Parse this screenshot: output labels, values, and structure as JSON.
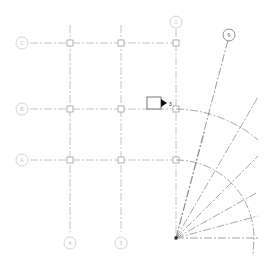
{
  "view": {
    "title": "Grid Plan View"
  },
  "colors": {
    "grid_line": "#b8b8b8",
    "radial_line": "#909090",
    "bubble": "#c8c8c8",
    "marker": "#a0a0a0",
    "elevation_tag": "#111111"
  },
  "grids": {
    "vertical": [
      {
        "label": "4",
        "x": 70
      },
      {
        "label": "5",
        "x": 121
      },
      {
        "label": "1",
        "x": 176
      }
    ],
    "horizontal": [
      {
        "label": "C",
        "y": 43
      },
      {
        "label": "B",
        "y": 109
      },
      {
        "label": "A",
        "y": 160
      }
    ],
    "radial_bubble": {
      "label": "6"
    }
  },
  "elevation_marker": {
    "label": "3"
  }
}
